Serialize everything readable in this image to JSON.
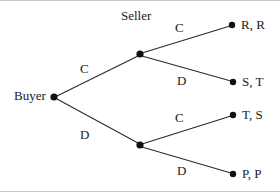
{
  "diagram": {
    "type": "extensive-form-game-tree",
    "background_color": "#ffffff",
    "line_color": "#2b2b2b",
    "node_color": "#111111",
    "text_color": "#1a1a1a",
    "players": {
      "root_player": "Buyer",
      "second_player": "Seller"
    },
    "nodes": {
      "root": {
        "id": "buyer",
        "x": 54,
        "y": 97,
        "label": "Buyer"
      },
      "seller_upper": {
        "id": "seller-upper",
        "x": 140,
        "y": 54,
        "label": "Seller"
      },
      "seller_lower": {
        "id": "seller-lower",
        "x": 140,
        "y": 145,
        "label": ""
      }
    },
    "terminals": [
      {
        "id": "terminal-rr",
        "x": 232,
        "y": 25,
        "payoff": "R, R"
      },
      {
        "id": "terminal-st",
        "x": 233,
        "y": 82,
        "payoff": "S, T"
      },
      {
        "id": "terminal-ts",
        "x": 233,
        "y": 115,
        "payoff": "T, S"
      },
      {
        "id": "terminal-pp",
        "x": 233,
        "y": 174,
        "payoff": "P, P"
      }
    ],
    "edges": [
      {
        "id": "buyer-c",
        "from": "buyer",
        "to": "seller-upper",
        "action": "C",
        "label_x": 80,
        "label_y": 62
      },
      {
        "id": "buyer-d",
        "from": "buyer",
        "to": "seller-lower",
        "action": "D",
        "label_x": 80,
        "label_y": 128
      },
      {
        "id": "seller-upper-c",
        "from": "seller-upper",
        "to": "terminal-rr",
        "action": "C",
        "label_x": 175,
        "label_y": 21
      },
      {
        "id": "seller-upper-d",
        "from": "seller-upper",
        "to": "terminal-st",
        "action": "D",
        "label_x": 177,
        "label_y": 74
      },
      {
        "id": "seller-lower-c",
        "from": "seller-lower",
        "to": "terminal-ts",
        "action": "C",
        "label_x": 175,
        "label_y": 111
      },
      {
        "id": "seller-lower-d",
        "from": "seller-lower",
        "to": "terminal-pp",
        "action": "D",
        "label_x": 177,
        "label_y": 164
      }
    ],
    "seller_caption": {
      "text": "Seller",
      "x": 121,
      "y": 9
    },
    "buyer_caption": {
      "text": "Buyer",
      "x": 14,
      "y": 89
    }
  }
}
